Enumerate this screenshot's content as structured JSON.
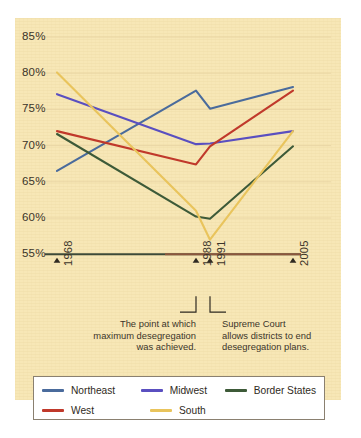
{
  "panel": {
    "background": "#f7e7b6"
  },
  "chart_data": {
    "type": "line",
    "title": "",
    "subtitle": "",
    "xlabel": "",
    "ylabel": "",
    "x": [
      1968,
      1988,
      1991,
      2005
    ],
    "categories": [
      "1968",
      "1988",
      "1991",
      "2005"
    ],
    "ylim": [
      55,
      85
    ],
    "ytick_values": [
      85,
      80,
      75,
      70,
      65,
      60,
      55
    ],
    "ytick_labels": [
      "85%",
      "80%",
      "75%",
      "70%",
      "65%",
      "60%",
      "55%"
    ],
    "xtick_labels": [
      "1968",
      "1988",
      "1991",
      "2005"
    ],
    "grid": false,
    "legend_position": "bottom",
    "value_suffix": "%",
    "series": [
      {
        "name": "Northeast",
        "color": "#4a6b9c",
        "values": [
          66.5,
          77.6,
          75.1,
          78.1
        ]
      },
      {
        "name": "Midwest",
        "color": "#5a4fc0",
        "values": [
          77.1,
          70.2,
          70.3,
          72.0
        ]
      },
      {
        "name": "Border States",
        "color": "#3d5a38",
        "values": [
          71.6,
          60.2,
          59.9,
          69.9
        ]
      },
      {
        "name": "West",
        "color": "#c0392b",
        "values": [
          72.0,
          67.4,
          69.9,
          77.6
        ]
      },
      {
        "name": "South",
        "color": "#e9c45c",
        "values": [
          80.1,
          61.0,
          57.0,
          72.0
        ]
      }
    ]
  },
  "annotations": [
    {
      "id": "max-desegregation",
      "text": "The point at which\nmaximum desegregation\nwas achieved.",
      "anchor_year": "1988"
    },
    {
      "id": "supreme-court",
      "text": "Supreme Court\nallows districts to end\ndesegregation plans.",
      "anchor_year": "1991"
    }
  ],
  "legend": {
    "items": [
      {
        "label": "Northeast",
        "color": "#4a6b9c"
      },
      {
        "label": "Midwest",
        "color": "#5a4fc0"
      },
      {
        "label": "Border States",
        "color": "#3d5a38"
      },
      {
        "label": "West",
        "color": "#c0392b"
      },
      {
        "label": "South",
        "color": "#e9c45c"
      }
    ]
  }
}
